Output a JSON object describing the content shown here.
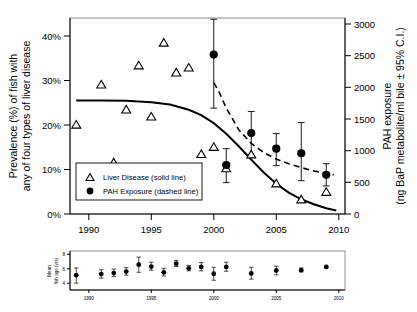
{
  "chart_data": {
    "type": "scatter",
    "title": "",
    "xlabel": "",
    "ylabel": "Prevalence (%) of fish with any of four types of liver disease",
    "y2label": "PAH exposure (ng BaP metabolite/ml bile ± 95% C.I.)",
    "xlim": [
      1988.5,
      2010.5
    ],
    "ylim": [
      0,
      44
    ],
    "y2lim": [
      0,
      3000
    ],
    "grid": false,
    "legend_position": "lower-left-inside",
    "xticks": [
      1990,
      1995,
      2000,
      2005,
      2010
    ],
    "xtick_labels": [
      "1990",
      "1995",
      "2000",
      "2005",
      "2010"
    ],
    "yticks": [
      0,
      10,
      20,
      30,
      40
    ],
    "ytick_labels": [
      "0%",
      "10%",
      "20%",
      "30%",
      "40%"
    ],
    "y2ticks": [
      0,
      500,
      1000,
      1500,
      2000,
      2500,
      3000
    ],
    "y2tick_labels": [
      "0",
      "500",
      "1000",
      "1500",
      "2000",
      "2500",
      "3000"
    ],
    "series": [
      {
        "name": "Liver Disease (solid line)",
        "marker": "open-triangle",
        "axis": "left",
        "units": "percent",
        "x": [
          1989,
          1991,
          1992,
          1993,
          1994,
          1995,
          1996,
          1997,
          1998,
          1999,
          2000,
          2001,
          2003,
          2005,
          2007,
          2009
        ],
        "values": [
          20.0,
          29.0,
          11.5,
          23.4,
          33.3,
          21.8,
          38.4,
          31.7,
          32.8,
          13.4,
          15.0,
          10.2,
          13.3,
          6.8,
          3.2,
          4.9
        ]
      },
      {
        "name": "PAH Exposure (dashed line)",
        "marker": "filled-circle",
        "axis": "right",
        "units": "ng BaP metabolite/ml bile",
        "x": [
          2000,
          2001,
          2003,
          2005,
          2007,
          2009
        ],
        "values": [
          2440,
          750,
          1240,
          1000,
          930,
          600
        ],
        "err_low": [
          1620,
          480,
          870,
          740,
          510,
          430
        ],
        "err_high": [
          2980,
          1000,
          1570,
          1230,
          1400,
          770
        ]
      }
    ],
    "fits": [
      {
        "name": "Liver Disease fit (solid line)",
        "style": "solid",
        "axis": "left",
        "x": [
          1989.0,
          1991.0,
          1993.0,
          1995.0,
          1996.5,
          1998.0,
          1999.0,
          2000.0,
          2001.0,
          2002.0,
          2003.0,
          2004.0,
          2005.0,
          2006.0,
          2007.0,
          2008.0,
          2009.0,
          2009.8
        ],
        "values": [
          25.5,
          25.5,
          25.4,
          25.1,
          24.6,
          23.4,
          22.2,
          20.4,
          18.0,
          15.2,
          12.2,
          9.3,
          6.8,
          4.8,
          3.3,
          2.2,
          1.3,
          0.8
        ]
      },
      {
        "name": "PAH Exposure fit (dashed line)",
        "style": "dashed",
        "axis": "right",
        "x": [
          2000.0,
          2000.4,
          2001.0,
          2002.0,
          2003.0,
          2004.0,
          2005.0,
          2006.0,
          2007.0,
          2008.0,
          2009.0,
          2009.6
        ],
        "values": [
          2010,
          1880,
          1620,
          1290,
          1080,
          940,
          840,
          770,
          710,
          660,
          620,
          600
        ]
      }
    ],
    "subplot": {
      "type": "scatter",
      "ylabel": "Mean fish age (yrs)",
      "xlim": [
        1988.5,
        2010.5
      ],
      "ylim": [
        3.2,
        8.6
      ],
      "yticks": [
        4,
        6,
        8
      ],
      "ytick_labels": [
        "4",
        "6",
        "8"
      ],
      "xticks": [
        1990,
        1995,
        2000,
        2005,
        2010
      ],
      "xtick_labels": [
        "1990",
        "1995",
        "2000",
        "2005",
        "2010"
      ],
      "marker": "filled-circle",
      "x": [
        1989,
        1991,
        1992,
        1993,
        1994,
        1995,
        1996,
        1997,
        1998,
        1999,
        2000,
        2001,
        2003,
        2005,
        2007,
        2009
      ],
      "values": [
        5.25,
        5.4,
        5.55,
        5.75,
        6.7,
        6.45,
        5.65,
        6.85,
        6.2,
        6.4,
        5.45,
        6.4,
        5.5,
        5.9,
        5.95,
        6.4
      ],
      "err_low": [
        4.15,
        4.85,
        5.05,
        5.25,
        5.65,
        5.95,
        5.15,
        6.45,
        5.85,
        5.85,
        4.55,
        5.8,
        4.7,
        5.3,
        5.7,
        6.3
      ],
      "err_high": [
        6.25,
        6.0,
        6.1,
        6.3,
        7.75,
        7.05,
        6.2,
        7.3,
        6.6,
        7.0,
        6.35,
        7.05,
        6.35,
        6.5,
        6.25,
        6.5
      ]
    }
  },
  "legend": {
    "items": [
      {
        "label": "Liver Disease (solid line)",
        "marker": "open-triangle"
      },
      {
        "label": "PAH Exposure (dashed line)",
        "marker": "filled-circle"
      }
    ]
  },
  "axis_titles": {
    "left_line1": "Prevalence (%) of fish with",
    "left_line2": "any of four types of liver disease",
    "right_line1": "PAH exposure",
    "right_line2": "(ng BaP metabolite/ml bile ± 95% C.I.)",
    "subplot_line1": "Mean",
    "subplot_line2": "fish age (yrs)"
  },
  "colors": {
    "ink": "#000000",
    "frame": "#8a8a8a",
    "background": "#ffffff"
  }
}
